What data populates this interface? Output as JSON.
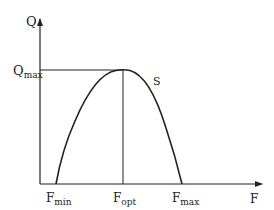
{
  "diagram": {
    "type": "parabola-optimum-curve",
    "axes": {
      "y_label": "Q",
      "x_label": "F"
    },
    "curve_label": "S",
    "y_marker": {
      "base": "Q",
      "sub": "max"
    },
    "x_markers": [
      {
        "base": "F",
        "sub": "min"
      },
      {
        "base": "F",
        "sub": "opt"
      },
      {
        "base": "F",
        "sub": "max"
      }
    ],
    "colors": {
      "line": "#222222",
      "background": "#ffffff"
    }
  }
}
